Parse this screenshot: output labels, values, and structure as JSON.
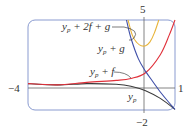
{
  "chart_data": {
    "type": "line",
    "title": "",
    "xlabel": "",
    "ylabel": "",
    "xlim": [
      -4,
      1
    ],
    "ylim": [
      -2,
      5
    ],
    "grid": false,
    "tick_labels": {
      "x_min": "−4",
      "x_max": "1",
      "y_max": "5",
      "y_min": "−2"
    },
    "series": [
      {
        "name": "y_p",
        "label_main": "y",
        "label_sub": "p",
        "label_rest": "",
        "color": "#3a3a3a",
        "x": [
          -4,
          -3,
          -2,
          -1,
          -0.5,
          0,
          0.5,
          1
        ],
        "y": [
          0.05,
          -0.05,
          0.05,
          0.0,
          -0.15,
          -0.5,
          -1.1,
          -1.95
        ]
      },
      {
        "name": "y_p + f",
        "label_main": "y",
        "label_sub": "p",
        "label_rest": " + f",
        "color": "#e0303a",
        "x": [
          -4,
          -3,
          -2,
          -1,
          -0.5,
          0,
          0.5,
          0.8,
          1
        ],
        "y": [
          0.05,
          -0.05,
          0.15,
          0.3,
          0.45,
          0.9,
          2.3,
          3.8,
          5.0
        ]
      },
      {
        "name": "y_p + g",
        "label_main": "y",
        "label_sub": "p",
        "label_rest": " + g",
        "color": "#3f4fa8",
        "x": [
          -0.65,
          -0.5,
          -0.25,
          0,
          0.25,
          0.5,
          0.75,
          1
        ],
        "y": [
          5.0,
          3.6,
          2.0,
          1.0,
          0.2,
          -0.6,
          -1.3,
          -1.95
        ]
      },
      {
        "name": "y_p + 2f + g",
        "label_main": "y",
        "label_sub": "p",
        "label_rest": " + 2f + g",
        "color": "#e8b43a",
        "x": [
          -0.6,
          -0.45,
          -0.3,
          -0.15,
          0,
          0.15,
          0.3,
          0.45
        ],
        "y": [
          5.0,
          3.8,
          3.25,
          3.0,
          3.0,
          3.3,
          4.0,
          5.0
        ]
      }
    ]
  },
  "colors": {
    "frame": "#8a9bd0",
    "axis": "#555555"
  }
}
